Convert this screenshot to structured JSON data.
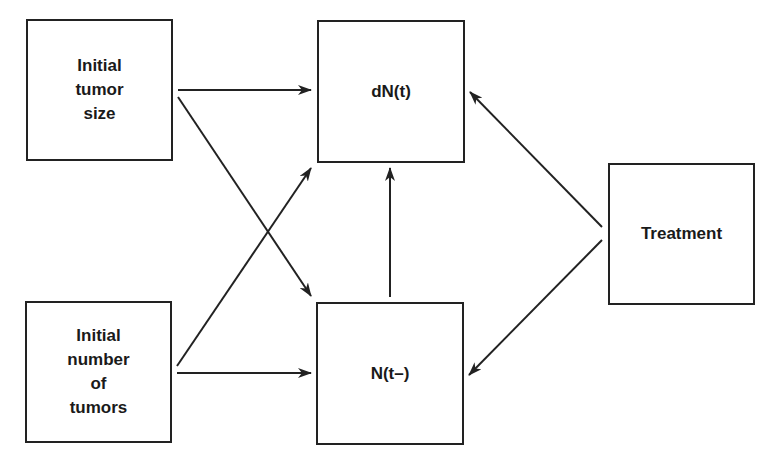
{
  "diagram": {
    "type": "causal-flow",
    "nodes": [
      {
        "id": "initial-tumor-size",
        "label": "Initial\ntumor\nsize",
        "x": 26,
        "y": 19,
        "w": 147,
        "h": 142
      },
      {
        "id": "dN",
        "label": "dN(t)",
        "x": 317,
        "y": 20,
        "w": 148,
        "h": 143
      },
      {
        "id": "initial-number-of-tumors",
        "label": "Initial\nnumber\nof\ntumors",
        "x": 25,
        "y": 301,
        "w": 147,
        "h": 142
      },
      {
        "id": "N",
        "label": "N(t–)",
        "x": 316,
        "y": 302,
        "w": 148,
        "h": 143
      },
      {
        "id": "treatment",
        "label": "Treatment",
        "x": 608,
        "y": 163,
        "w": 147,
        "h": 142
      }
    ],
    "edges": [
      {
        "from": "initial-tumor-size",
        "to": "dN",
        "x1": 178,
        "y1": 90,
        "x2": 311,
        "y2": 90
      },
      {
        "from": "initial-tumor-size",
        "to": "N",
        "x1": 178,
        "y1": 97,
        "x2": 311,
        "y2": 296
      },
      {
        "from": "initial-number-of-tumors",
        "to": "dN",
        "x1": 177,
        "y1": 366,
        "x2": 311,
        "y2": 168
      },
      {
        "from": "initial-number-of-tumors",
        "to": "N",
        "x1": 177,
        "y1": 373,
        "x2": 311,
        "y2": 373
      },
      {
        "from": "N",
        "to": "dN",
        "x1": 390,
        "y1": 297,
        "x2": 390,
        "y2": 168
      },
      {
        "from": "treatment",
        "to": "dN",
        "x1": 602,
        "y1": 227,
        "x2": 470,
        "y2": 92
      },
      {
        "from": "treatment",
        "to": "N",
        "x1": 602,
        "y1": 240,
        "x2": 469,
        "y2": 375
      }
    ],
    "colors": {
      "stroke": "#222222",
      "text": "#1a1a1a",
      "background": "#ffffff"
    }
  }
}
